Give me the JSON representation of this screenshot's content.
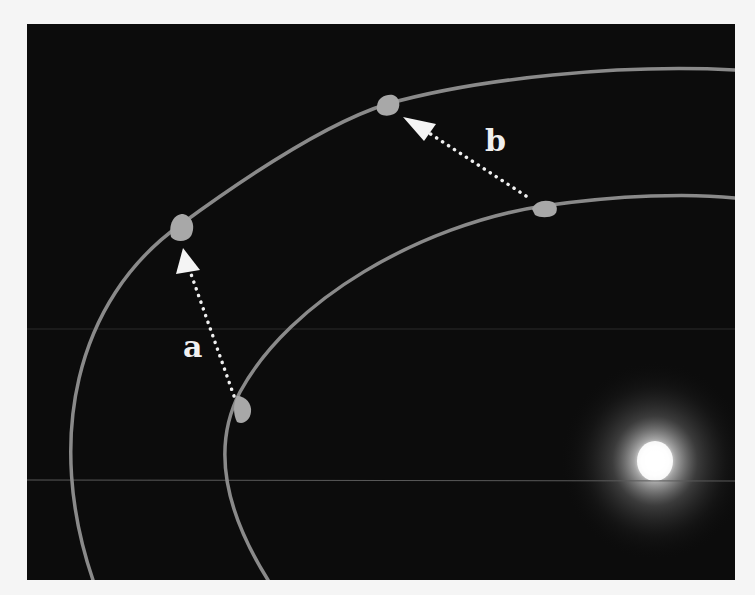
{
  "diagram": {
    "title": "",
    "colors": {
      "background": "#0c0c0c",
      "page": "#f5f5f5",
      "orbit": "#8a8a8a",
      "planet": "#a8a8a8",
      "arrow": "#f0f0f0",
      "label": "#f0f0f0",
      "star_core": "#ffffff",
      "star_glow": "#9a9a9a"
    },
    "labels": {
      "a": "a",
      "b": "b"
    },
    "orbits": [
      {
        "name": "outer-orbit"
      },
      {
        "name": "inner-orbit"
      }
    ],
    "planets": [
      {
        "name": "planet-outer-a",
        "x": 180,
        "y": 227
      },
      {
        "name": "planet-inner-a",
        "x": 240,
        "y": 408
      },
      {
        "name": "planet-outer-b",
        "x": 387,
        "y": 107
      },
      {
        "name": "planet-inner-b",
        "x": 543,
        "y": 208
      }
    ],
    "arrows": [
      {
        "name": "arrow-a",
        "label": "a",
        "from": [
          233,
          396
        ],
        "to": [
          184,
          248
        ]
      },
      {
        "name": "arrow-b",
        "label": "b",
        "from": [
          528,
          198
        ],
        "to": [
          405,
          117
        ]
      }
    ],
    "star": {
      "name": "star",
      "x": 655,
      "y": 461
    }
  }
}
